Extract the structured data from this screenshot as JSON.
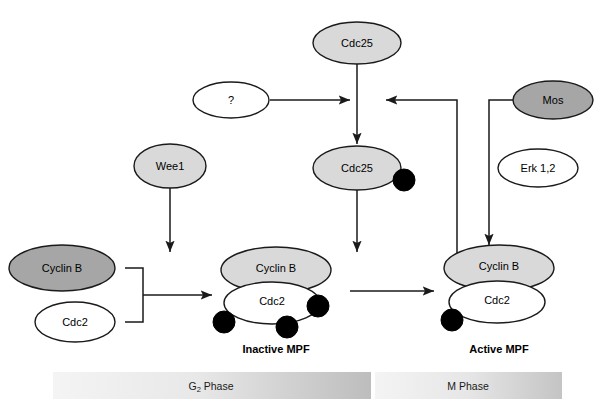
{
  "figure": {
    "width": 614,
    "height": 419,
    "background": "#ffffff"
  },
  "colors": {
    "fill_gray_light": "#d9d9d9",
    "fill_gray_dark": "#a6a6a6",
    "fill_white": "#ffffff",
    "stroke": "#1a1a1a",
    "phosphate": "#000000",
    "phase_bar_start": "#f2f2f2",
    "phase_bar_end": "#bfbfbf"
  },
  "nodes": {
    "cdc25_top": {
      "label": "Cdc25",
      "fill": "light"
    },
    "unknown": {
      "label": "?",
      "fill": "white"
    },
    "cdc25_phos": {
      "label": "Cdc25",
      "fill": "light"
    },
    "mos": {
      "label": "Mos",
      "fill": "dark"
    },
    "erk": {
      "label": "Erk 1,2",
      "fill": "white"
    },
    "wee1": {
      "label": "Wee1",
      "fill": "light"
    },
    "cyclin_b_free": {
      "label": "Cyclin B",
      "fill": "dark"
    },
    "cdc2_free": {
      "label": "Cdc2",
      "fill": "white"
    },
    "inactive_cyclin_b": {
      "label": "Cyclin B",
      "fill": "light"
    },
    "inactive_cdc2": {
      "label": "Cdc2",
      "fill": "white"
    },
    "active_cyclin_b": {
      "label": "Cyclin B",
      "fill": "light"
    },
    "active_cdc2": {
      "label": "Cdc2",
      "fill": "white"
    }
  },
  "complexes": {
    "inactive_mpf_label": "Inactive MPF",
    "active_mpf_label": "Active MPF",
    "inactive_mpf_phosphate_count": 3,
    "active_mpf_phosphate_count": 1,
    "cdc25_phosphate_count": 1
  },
  "phases": {
    "g2": {
      "text": "G",
      "subscript": "2",
      "suffix": " Phase"
    },
    "m": {
      "text": "M Phase"
    }
  }
}
